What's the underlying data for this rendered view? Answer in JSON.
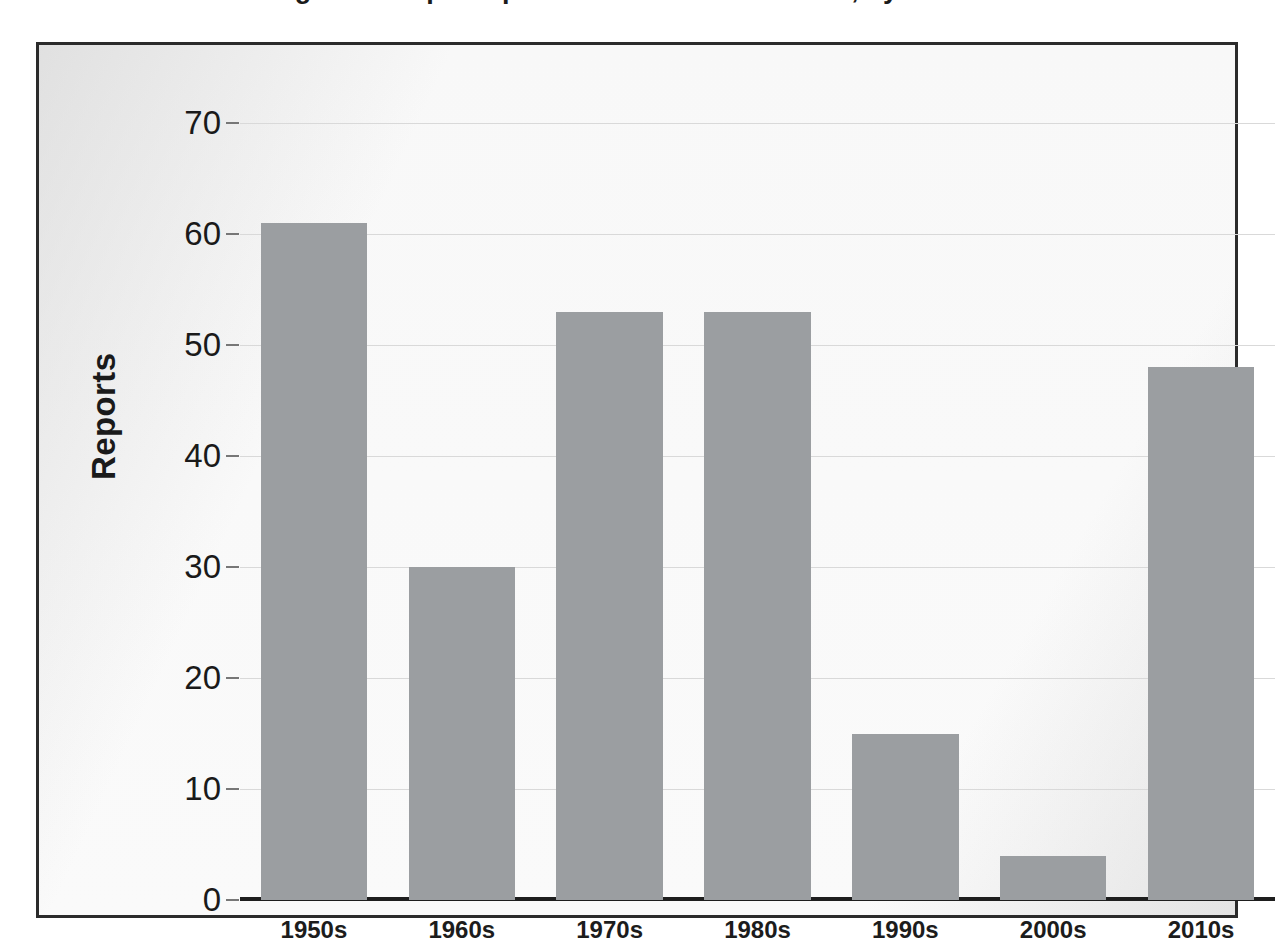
{
  "chart_data": {
    "type": "bar",
    "title": "Figure 1. Reports per decade in the database, by decade",
    "xlabel": "",
    "ylabel": "Reports",
    "categories": [
      "1950s",
      "1960s",
      "1970s",
      "1980s",
      "1990s",
      "2000s",
      "2010s"
    ],
    "values": [
      61,
      30,
      53,
      53,
      15,
      4,
      48
    ],
    "ylim": [
      0,
      70
    ],
    "yticks": [
      0,
      10,
      20,
      30,
      40,
      50,
      60,
      70
    ],
    "ytick_labels": [
      "0",
      "10",
      "20",
      "30",
      "40",
      "50",
      "60",
      "70"
    ],
    "grid": true,
    "legend": false,
    "legend_position": "none",
    "bar_color": "#9b9ea1",
    "axis_color": "#1e1e1e",
    "gridline_color": "#d9d9d9",
    "plot_background": "#fcfcfc",
    "frame_border_color": "#2b2b2b"
  }
}
